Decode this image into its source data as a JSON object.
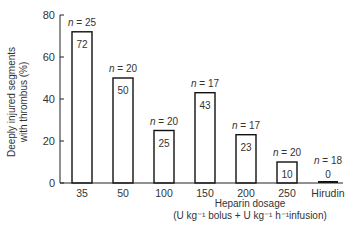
{
  "chart_data": {
    "type": "bar",
    "title": "",
    "xlabel": "Heparin dosage",
    "xlabel_units": "(U kg⁻¹ bolus + U kg⁻¹ h⁻¹infusion)",
    "ylabel": "Deeply injured segments with thrombus (%)",
    "ylabel_line1": "Deeply injured segments",
    "ylabel_line2": "with thrombus (%)",
    "ylim": [
      0,
      80
    ],
    "yticks": [
      0,
      20,
      40,
      60,
      80
    ],
    "grid": false,
    "legend": null,
    "categories": [
      "35",
      "50",
      "100",
      "150",
      "200",
      "250",
      "Hirudin"
    ],
    "values": [
      72,
      50,
      25,
      43,
      23,
      10,
      0
    ],
    "value_labels": [
      "72",
      "50",
      "25",
      "43",
      "23",
      "10",
      "0"
    ],
    "n_labels": [
      "n = 25",
      "n = 20",
      "n = 20",
      "n = 17",
      "n = 17",
      "n = 20",
      "n = 18"
    ]
  },
  "colors": {
    "axis": "#222222",
    "bar_fill": "#ffffff",
    "bar_stroke": "#111111",
    "text": "#333333"
  }
}
